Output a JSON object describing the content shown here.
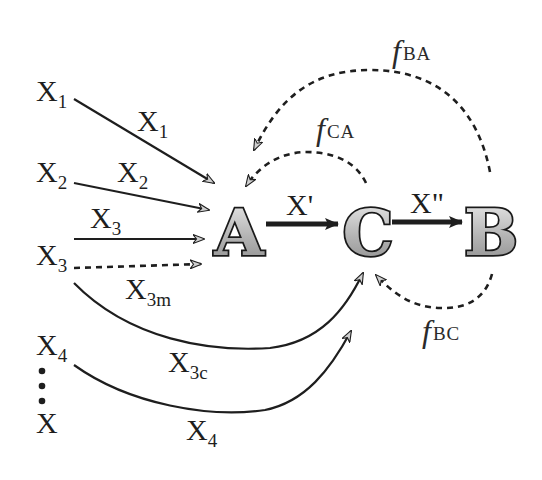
{
  "diagram": {
    "nodes": {
      "A": "A",
      "C": "C",
      "B": "B"
    },
    "inputs": [
      {
        "id": "X1",
        "base": "X",
        "sub": "1"
      },
      {
        "id": "X2",
        "base": "X",
        "sub": "2"
      },
      {
        "id": "X3",
        "base": "X",
        "sub": "3"
      },
      {
        "id": "X4",
        "base": "X",
        "sub": "4"
      },
      {
        "id": "X",
        "base": "X",
        "sub": ""
      }
    ],
    "edge_labels": {
      "x1": {
        "base": "X",
        "sub": "1"
      },
      "x2": {
        "base": "X",
        "sub": "2"
      },
      "x3": {
        "base": "X",
        "sub": "3"
      },
      "x3m": {
        "base": "X",
        "sub": "3m"
      },
      "x3c": {
        "base": "X",
        "sub": "3c"
      },
      "x4": {
        "base": "X",
        "sub": "4"
      },
      "a_to_c": "X'",
      "c_to_b": "X\""
    },
    "feedback_labels": {
      "f_ba": {
        "base": "f",
        "sub": "BA"
      },
      "f_ca": {
        "base": "f",
        "sub": "CA"
      },
      "f_bc": {
        "base": "f",
        "sub": "BC"
      }
    },
    "ellipsis": "⋮",
    "colors": {
      "ink": "#1e1e1e",
      "node_fill_light": "#e6e6e6",
      "node_fill_dark": "#8a8a8a",
      "background": "#ffffff"
    }
  }
}
